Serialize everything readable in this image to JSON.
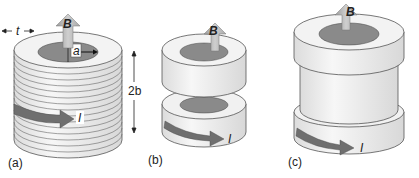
{
  "figure": {
    "panels": [
      {
        "id": "a",
        "label": "(a)",
        "description": "Cylinder wound with many stacked turns of tape",
        "field_label": "B",
        "current_label": "I",
        "radius_label": "a",
        "thickness_label": "t",
        "height_label": "2b"
      },
      {
        "id": "b",
        "label": "(b)",
        "description": "Two separated disk coils (Helmholtz-like pair)",
        "field_label": "B",
        "current_label": "I"
      },
      {
        "id": "c",
        "label": "(c)",
        "description": "Two end disk coils joined by a central cylinder",
        "field_label": "B",
        "current_label": "I"
      }
    ],
    "colors": {
      "coil_face": "#f2f2f2",
      "coil_side": "#eaeaea",
      "outline": "#555555",
      "bore": "#8a8a8a",
      "field_arrow": "#bdbdbd",
      "current_arrow": "#6f6f6f"
    }
  }
}
